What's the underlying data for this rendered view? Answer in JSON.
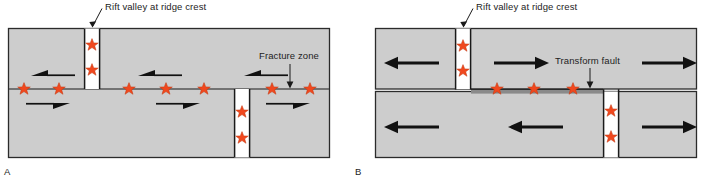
{
  "figure": {
    "title_absent": true,
    "colors": {
      "block_fill": "#cdcdcd",
      "block_stroke": "#2b2b2b",
      "star_fill": "#f0481e",
      "star_stroke": "#b02d0d",
      "rift_valley_fill": "#ffffff",
      "transform_fault_band": "#8a8a8a",
      "arrow": "#111111",
      "text": "#1d1d1d",
      "background": "#ffffff"
    }
  },
  "panels": [
    {
      "id": "A",
      "tag": "A",
      "callouts": [
        {
          "name": "rift-valley",
          "text": "Rift valley at ridge crest"
        },
        {
          "name": "fracture-zone",
          "text": "Fracture zone"
        }
      ],
      "features": {
        "ridge_segments": 2,
        "stars_on_line": 7,
        "stars_in_rift_upper": 2,
        "stars_in_rift_lower": 2,
        "arrow_style": "half-wedge",
        "arrows_upper": [
          "left",
          "left",
          "left"
        ],
        "arrows_lower": [
          "right",
          "right",
          "right"
        ]
      }
    },
    {
      "id": "B",
      "tag": "B",
      "callouts": [
        {
          "name": "rift-valley",
          "text": "Rift valley at ridge crest"
        },
        {
          "name": "transform-fault",
          "text": "Transform fault"
        }
      ],
      "features": {
        "ridge_segments": 2,
        "stars_on_band": 3,
        "stars_in_rift_upper": 2,
        "stars_in_rift_lower": 2,
        "arrow_style": "solid-arrow",
        "arrows_upper": [
          "left",
          "right",
          "right"
        ],
        "arrows_lower": [
          "left",
          "left",
          "right"
        ]
      }
    }
  ]
}
